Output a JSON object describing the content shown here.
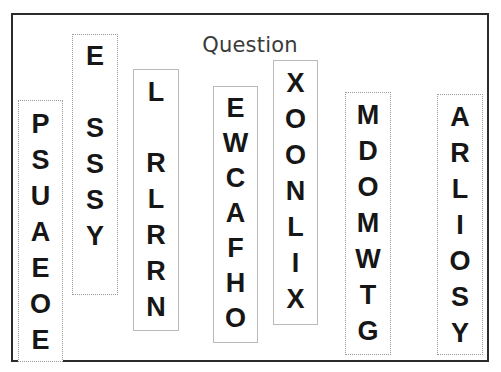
{
  "page": {
    "title": "Question",
    "background": "#ffffff",
    "frame_border_color": "#2b2b2b"
  },
  "columns": [
    {
      "id": "column-1",
      "border_style": "dotted",
      "border_color": "#9a9a9a",
      "x": 18,
      "y": 100,
      "width": 45,
      "height": 262,
      "pad_top": 10,
      "gap": 9,
      "letters": [
        "P",
        "S",
        "U",
        "A",
        "E",
        "O",
        "E"
      ]
    },
    {
      "id": "column-2",
      "border_style": "dotted",
      "border_color": "#9a9a9a",
      "x": 72,
      "y": 34,
      "width": 46,
      "height": 261,
      "pad_top": 8,
      "gap": 9,
      "letters": [
        "E",
        "",
        "S",
        "S",
        "S",
        "Y"
      ]
    },
    {
      "id": "column-3",
      "border_style": "solid",
      "border_color": "#b9b9b9",
      "x": 133,
      "y": 69,
      "width": 46,
      "height": 262,
      "pad_top": 9,
      "gap": 9,
      "letters": [
        "L",
        "",
        "R",
        "L",
        "R",
        "R",
        "N"
      ]
    },
    {
      "id": "column-4",
      "border_style": "solid",
      "border_color": "#b9b9b9",
      "x": 213,
      "y": 86,
      "width": 45,
      "height": 257,
      "pad_top": 8,
      "gap": 8,
      "letters": [
        "E",
        "W",
        "C",
        "A",
        "F",
        "H",
        "O"
      ]
    },
    {
      "id": "column-5",
      "border_style": "solid",
      "border_color": "#b9b9b9",
      "x": 273,
      "y": 60,
      "width": 45,
      "height": 265,
      "pad_top": 9,
      "gap": 9,
      "letters": [
        "X",
        "O",
        "O",
        "N",
        "L",
        "I",
        "X"
      ]
    },
    {
      "id": "column-6",
      "border_style": "dotted",
      "border_color": "#9a9a9a",
      "x": 345,
      "y": 92,
      "width": 46,
      "height": 263,
      "pad_top": 9,
      "gap": 9,
      "letters": [
        "M",
        "D",
        "O",
        "M",
        "W",
        "T",
        "G"
      ]
    },
    {
      "id": "column-7",
      "border_style": "dotted",
      "border_color": "#9a9a9a",
      "x": 437,
      "y": 94,
      "width": 46,
      "height": 261,
      "pad_top": 9,
      "gap": 9,
      "letters": [
        "A",
        "R",
        "L",
        "I",
        "O",
        "S",
        "Y"
      ]
    }
  ]
}
